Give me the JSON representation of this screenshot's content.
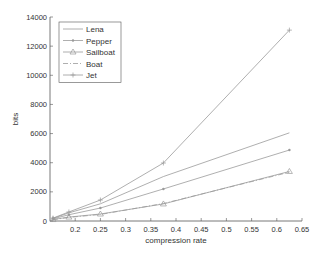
{
  "chart_data": {
    "type": "line",
    "title": "",
    "xlabel": "compression rate",
    "ylabel": "bits",
    "xlim": [
      0.15,
      0.65
    ],
    "ylim": [
      0,
      14000
    ],
    "xticks": [
      0.2,
      0.25,
      0.3,
      0.35,
      0.4,
      0.45,
      0.5,
      0.55,
      0.6,
      0.65
    ],
    "xtick_labels": [
      "0.2",
      "0.25",
      "0.3",
      "0.35",
      "0.4",
      "0.45",
      "0.5",
      "0.55",
      "0.6",
      "0.65"
    ],
    "yticks": [
      0,
      2000,
      4000,
      6000,
      8000,
      10000,
      12000,
      14000
    ],
    "ytick_labels": [
      "0",
      "2000",
      "4000",
      "6000",
      "8000",
      "10000",
      "12000",
      "14000"
    ],
    "grid": false,
    "legend_position": "upper left",
    "x": [
      0.156,
      0.1875,
      0.25,
      0.375,
      0.625
    ],
    "series": [
      {
        "name": "Lena",
        "style": "solid",
        "marker": "none",
        "values": [
          180,
          560,
          1180,
          3050,
          6050
        ]
      },
      {
        "name": "Pepper",
        "style": "solid",
        "marker": "dot",
        "values": [
          150,
          430,
          890,
          2200,
          4870
        ]
      },
      {
        "name": "Sailboat",
        "style": "solid",
        "marker": "triangle",
        "values": [
          100,
          270,
          480,
          1170,
          3400
        ]
      },
      {
        "name": "Boat",
        "style": "dashdot",
        "marker": "none",
        "values": [
          90,
          250,
          450,
          1200,
          3350
        ]
      },
      {
        "name": "Jet",
        "style": "solid",
        "marker": "plus",
        "values": [
          200,
          620,
          1440,
          3980,
          13100
        ]
      }
    ]
  },
  "colors": {
    "line": "#9a9a9a",
    "axis": "#555555",
    "text": "#333333"
  }
}
